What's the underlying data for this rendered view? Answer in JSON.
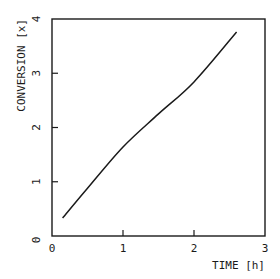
{
  "chart_data": {
    "type": "line",
    "title": "",
    "xlabel": "TIME [h]",
    "ylabel": "CONVERSION [x]",
    "xlim": [
      0,
      3
    ],
    "ylim": [
      0,
      4
    ],
    "xticks": [
      "0",
      "1",
      "2",
      "3"
    ],
    "yticks": [
      "0",
      "1",
      "2",
      "3",
      "4"
    ],
    "grid": false,
    "legend": null,
    "series": [
      {
        "name": "conversion",
        "x": [
          0.15,
          0.5,
          1.0,
          1.5,
          2.0,
          2.6
        ],
        "y": [
          0.33,
          0.88,
          1.64,
          2.25,
          2.84,
          3.76
        ]
      }
    ]
  },
  "style": {
    "line_color": "#1a1a1a",
    "frame_color": "#1a1a1a",
    "background": "#ffffff"
  }
}
